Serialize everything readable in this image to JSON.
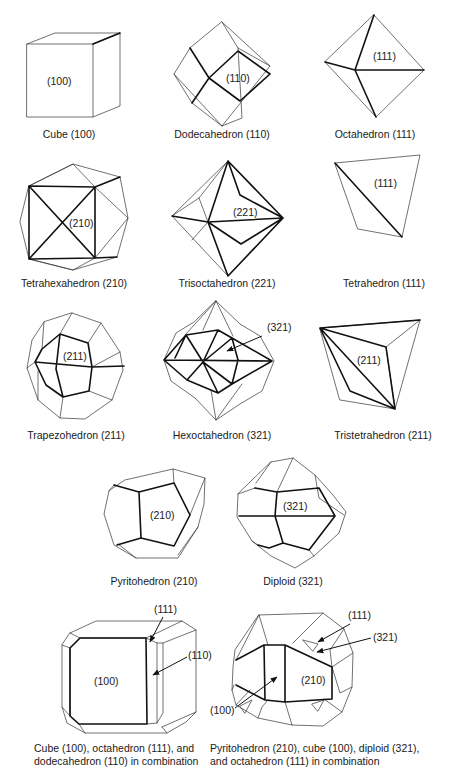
{
  "figure": {
    "items": [
      {
        "id": "cube",
        "name": "Cube",
        "miller": "(100)",
        "caption": "Cube (100)",
        "face_label": "(100)"
      },
      {
        "id": "dodecahedron",
        "name": "Dodecahedron",
        "miller": "(110)",
        "caption": "Dodecahedron (110)",
        "face_label": "(110)"
      },
      {
        "id": "octahedron",
        "name": "Octahedron",
        "miller": "(111)",
        "caption": "Octahedron (111)",
        "face_label": "(111)"
      },
      {
        "id": "tetrahexahedron",
        "name": "Tetrahexahedron",
        "miller": "(210)",
        "caption": "Tetrahexahedron (210)",
        "face_label": "(210)"
      },
      {
        "id": "trisoctahedron",
        "name": "Trisoctahedron",
        "miller": "(221)",
        "caption": "Trisoctahedron (221)",
        "face_label": "(221)"
      },
      {
        "id": "tetrahedron",
        "name": "Tetrahedron",
        "miller": "(111)",
        "caption": "Tetrahedron (111)",
        "face_label": "(111)"
      },
      {
        "id": "trapezohedron",
        "name": "Trapezohedron",
        "miller": "(211)",
        "caption": "Trapezohedron (211)",
        "face_label": "(211)"
      },
      {
        "id": "hexoctahedron",
        "name": "Hexoctahedron",
        "miller": "(321)",
        "caption": "Hexoctahedron (321)",
        "face_label": "(321)"
      },
      {
        "id": "tristetrahedron",
        "name": "Tristetrahedron",
        "miller": "(211)",
        "caption": "Tristetrahedron (211)",
        "face_label": "(211)"
      },
      {
        "id": "pyritohedron",
        "name": "Pyritohedron",
        "miller": "(210)",
        "caption": "Pyritohedron (210)",
        "face_label": "(210)"
      },
      {
        "id": "diploid",
        "name": "Diploid",
        "miller": "(321)",
        "caption": "Diploid (321)",
        "face_label": "(321)"
      }
    ],
    "combinations": [
      {
        "id": "combo-cube",
        "caption_lines": [
          "Cube (100), octahedron (111), and",
          "dodecahedron (110) in combination"
        ],
        "labels": {
          "main": "(100)",
          "corner": "(111)",
          "edge": "(110)"
        }
      },
      {
        "id": "combo-pyrito",
        "caption_lines": [
          "Pyritohedron (210), cube (100), diploid (321),",
          "and octahedron (111) in combination"
        ],
        "labels": {
          "main": "(210)",
          "cube": "(100)",
          "octa": "(111)",
          "diploid": "(321)"
        }
      }
    ]
  }
}
